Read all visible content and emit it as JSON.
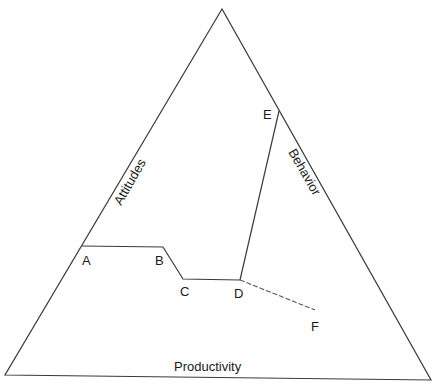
{
  "diagram": {
    "type": "triangle",
    "line_color": "#3a3a3a",
    "vertices": {
      "apex": [
        222,
        9
      ],
      "bottom_left": [
        5,
        375
      ],
      "bottom_right": [
        431,
        380
      ]
    },
    "sides": {
      "left": "Attitudes",
      "right": "Behavior",
      "bottom": "Productivity"
    },
    "points": {
      "A": {
        "label": "A",
        "xy": [
          82,
          246
        ]
      },
      "B": {
        "label": "B",
        "xy": [
          163,
          247
        ]
      },
      "C": {
        "label": "C",
        "xy": [
          183,
          279
        ]
      },
      "D": {
        "label": "D",
        "xy": [
          240,
          280
        ]
      },
      "E": {
        "label": "E",
        "xy": [
          279,
          111
        ]
      },
      "F": {
        "label": "F",
        "xy": [
          315,
          310
        ]
      }
    },
    "paths": [
      {
        "from": "A",
        "to": "B",
        "style": "solid"
      },
      {
        "from": "B",
        "to": "C",
        "style": "solid"
      },
      {
        "from": "C",
        "to": "D",
        "style": "solid"
      },
      {
        "from": "D",
        "to": "E",
        "style": "solid"
      },
      {
        "from": "D",
        "to": "F",
        "style": "dashed"
      }
    ]
  }
}
